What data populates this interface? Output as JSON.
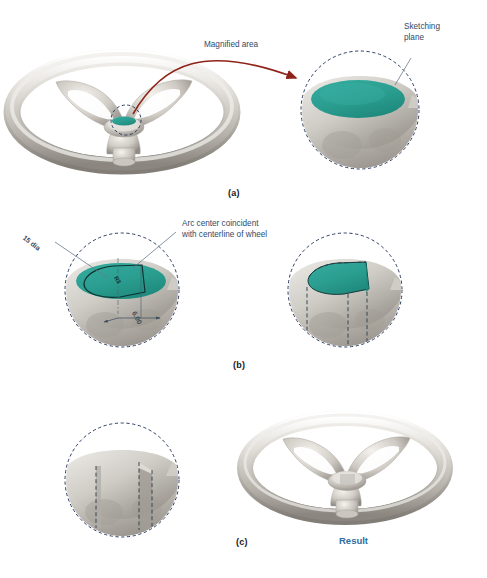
{
  "figure": {
    "background": "#ffffff",
    "colors": {
      "sketch_plane_teal": "#2a9d8f",
      "annotation_blue": "#2e4a6b",
      "result_blue": "#2e6da4",
      "arrow_red": "#8e2418",
      "dashed_circle_navy": "#2c3d63",
      "metal_light": "#e8e6e2",
      "metal_mid": "#b9b5ae",
      "metal_dark": "#7d7a74",
      "sketch_outline": "#123a38"
    }
  },
  "panels": [
    {
      "id": "a",
      "caption": "(a)",
      "annotations": [
        {
          "name": "magnified-area-label",
          "text": "Magnified area"
        },
        {
          "name": "sketching-plane-label",
          "text": "Sketching\nplane"
        }
      ]
    },
    {
      "id": "b",
      "caption": "(b)",
      "annotations": [
        {
          "name": "arc-center-note",
          "text": "Arc center coincident\nwith centerline of wheel"
        },
        {
          "name": "diameter-dimension",
          "text": "15 dia"
        },
        {
          "name": "width-dimension",
          "text": "6.00"
        },
        {
          "name": "radius-dimension",
          "text": "R3"
        }
      ]
    },
    {
      "id": "c",
      "caption": "(c)",
      "annotations": [
        {
          "name": "result-label",
          "text": "Result"
        }
      ]
    }
  ],
  "captions": {
    "a": "(a)",
    "b": "(b)",
    "c": "(c)"
  },
  "labels": {
    "magnified_area": "Magnified area",
    "sketching_plane_line1": "Sketching",
    "sketching_plane_line2": "plane",
    "arc_center_line1": "Arc center coincident",
    "arc_center_line2": "with centerline of wheel",
    "dia_15": "15 dia",
    "dim_600": "6.00",
    "dim_r3": "R3",
    "result": "Result"
  }
}
